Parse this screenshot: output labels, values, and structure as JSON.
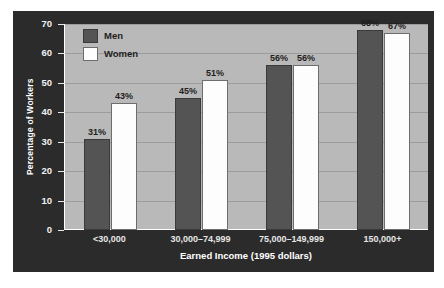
{
  "chart_data": {
    "type": "bar",
    "title": "",
    "subtitle": "",
    "xlabel": "Earned Income (1995 dollars)",
    "ylabel": "Percentage of Workers",
    "categories": [
      "<30,000",
      "30,000–74,999",
      "75,000–149,999",
      "150,000+"
    ],
    "series": [
      {
        "name": "Men",
        "values": [
          31,
          45,
          56,
          68
        ],
        "color": "#545454",
        "labels": [
          "31%",
          "45%",
          "56%",
          "68%"
        ]
      },
      {
        "name": "Women",
        "values": [
          43,
          51,
          56,
          67
        ],
        "color": "#fdfdfd",
        "labels": [
          "43%",
          "51%",
          "56%",
          "67%"
        ]
      }
    ],
    "ylim": [
      0,
      70
    ],
    "ytick_values": [
      0,
      10,
      20,
      30,
      40,
      50,
      60,
      70
    ],
    "ytick_labels": [
      "0",
      "10",
      "20",
      "30",
      "40",
      "50",
      "60",
      "70"
    ],
    "grid": true,
    "grid_axis": "y",
    "legend_position": "top-left",
    "value_label_suffix": "%"
  },
  "legend": {
    "entries": [
      {
        "label": "Men",
        "swatch": "men"
      },
      {
        "label": "Women",
        "swatch": "women"
      }
    ]
  },
  "colors": {
    "panel_background": "#2b2b2b",
    "plot_background": "#b9b9b9",
    "gridline": "#9c9c9c",
    "men_bar": "#545454",
    "women_bar": "#fdfdfd",
    "axis_text": "#f2f2f2",
    "value_label_text": "#1e1e1e"
  }
}
